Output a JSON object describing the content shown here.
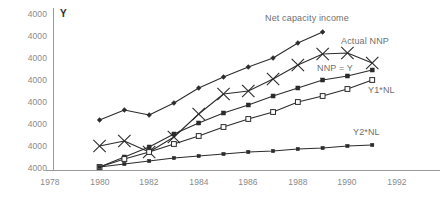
{
  "axis": {
    "y_label": "Y",
    "y_ticks": [
      "4000",
      "4000",
      "4000",
      "4000",
      "4000",
      "4000",
      "4000",
      "4000"
    ],
    "x_ticks": [
      "1978",
      "1980",
      "1982",
      "1984",
      "1986",
      "1988",
      "1990",
      "1992"
    ]
  },
  "series_labels": {
    "net_capacity_income": "Net capacity income",
    "actual_nnp": "Actual NNP",
    "nnp_equals_y": "NNP = Y",
    "y1_nl": "Y1*NL",
    "y2_nl": "Y2*NL"
  },
  "colors": {
    "line": "#2b2b2b",
    "axis": "#9a9a9a",
    "tick_text": "#8a8a8a",
    "series_text": "#6f6f6f",
    "background": "#ffffff"
  },
  "chart_data": {
    "type": "line",
    "title": "",
    "xlabel": "",
    "ylabel": "Y",
    "grid": false,
    "legend_position": "inline-right-of-series",
    "xlim": [
      1978,
      1992
    ],
    "x_tick_values": [
      1978,
      1980,
      1982,
      1984,
      1986,
      1988,
      1990,
      1992
    ],
    "y_tick_labels": [
      "4000",
      "4000",
      "4000",
      "4000",
      "4000",
      "4000",
      "4000",
      "4000"
    ],
    "series": [
      {
        "name": "Net capacity income",
        "marker": "filled-diamond",
        "x": [
          1980,
          1981,
          1982,
          1983,
          1984,
          1985,
          1986,
          1987,
          1988,
          1989
        ],
        "y_px": [
          120,
          110,
          115,
          103,
          88,
          77,
          67,
          58,
          43,
          32
        ],
        "values": [
          4300,
          4420,
          4360,
          4505,
          4685,
          4820,
          4940,
          5050,
          5230,
          5365
        ]
      },
      {
        "name": "Actual NNP",
        "marker": "x-cross",
        "x": [
          1980,
          1981,
          1982,
          1983,
          1984,
          1985,
          1986,
          1987,
          1988,
          1989,
          1990,
          1991
        ],
        "y_px": [
          146,
          141,
          152,
          137,
          114,
          94,
          91,
          79,
          65,
          54,
          53,
          63
        ],
        "values": [
          4000,
          4060,
          3930,
          4110,
          4390,
          4635,
          4670,
          4815,
          4985,
          5120,
          5130,
          5010
        ]
      },
      {
        "name": "NNP = Y",
        "marker": "filled-square",
        "x": [
          1980,
          1981,
          1982,
          1983,
          1984,
          1985,
          1986,
          1987,
          1988,
          1989,
          1990,
          1991
        ],
        "y_px": [
          167,
          157,
          147,
          134,
          123,
          113,
          105,
          96,
          88,
          80,
          76,
          70
        ],
        "values": [
          3745,
          3865,
          3985,
          4145,
          4280,
          4400,
          4500,
          4610,
          4705,
          4805,
          4850,
          4925
        ]
      },
      {
        "name": "Y1*NL",
        "marker": "open-square",
        "x": [
          1980,
          1981,
          1982,
          1983,
          1984,
          1985,
          1986,
          1987,
          1988,
          1989,
          1990,
          1991
        ],
        "y_px": [
          167,
          159,
          152,
          144,
          136,
          127,
          119,
          112,
          102,
          96,
          89,
          80
        ],
        "values": [
          3745,
          3845,
          3930,
          4025,
          4125,
          4235,
          4330,
          4415,
          4540,
          4610,
          4695,
          4805
        ]
      },
      {
        "name": "Y2*NL",
        "marker": "small-filled-square",
        "x": [
          1980,
          1981,
          1982,
          1983,
          1984,
          1985,
          1986,
          1987,
          1988,
          1989,
          1990,
          1991
        ],
        "y_px": [
          167,
          164,
          161,
          158,
          156,
          154,
          152,
          151,
          149,
          148,
          146,
          145
        ],
        "values": [
          3745,
          3785,
          3820,
          3855,
          3880,
          3905,
          3930,
          3940,
          3965,
          3975,
          4000,
          4010
        ]
      }
    ]
  }
}
